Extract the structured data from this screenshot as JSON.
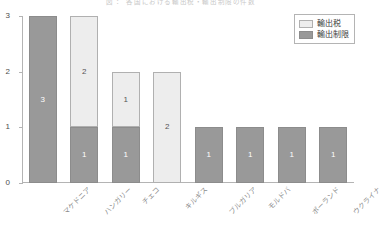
{
  "chart_data": {
    "type": "bar",
    "title": "図 ：  各国における輸出税・輸出制限の件数",
    "xlabel": "",
    "ylabel": "",
    "ylim": [
      0,
      3
    ],
    "yticks": [
      "0",
      "1",
      "2",
      "3"
    ],
    "grid": false,
    "stacked": true,
    "legend_position": "top-right",
    "categories": [
      "マケドニア",
      "ハンガリー",
      "チェコ",
      "キルギス",
      "ブルガリア",
      "モルドバ",
      "ポーランド",
      "ウクライナ"
    ],
    "series": [
      {
        "name": "輸出制限",
        "color": "#999999",
        "values": [
          3,
          1,
          1,
          0,
          1,
          1,
          1,
          1
        ]
      },
      {
        "name": "輸出税",
        "color": "#ededed",
        "values": [
          0,
          2,
          1,
          2,
          0,
          0,
          0,
          0
        ]
      }
    ],
    "bar_labels": [
      [
        {
          "series": "輸出制限",
          "text": "3"
        }
      ],
      [
        {
          "series": "輸出制限",
          "text": "1"
        },
        {
          "series": "輸出税",
          "text": "2"
        }
      ],
      [
        {
          "series": "輸出制限",
          "text": "1"
        },
        {
          "series": "輸出税",
          "text": "1"
        }
      ],
      [
        {
          "series": "輸出税",
          "text": "2"
        }
      ],
      [
        {
          "series": "輸出制限",
          "text": "1"
        }
      ],
      [
        {
          "series": "輸出制限",
          "text": "1"
        }
      ],
      [
        {
          "series": "輸出制限",
          "text": "1"
        }
      ],
      [
        {
          "series": "輸出制限",
          "text": "1"
        }
      ]
    ]
  },
  "legend": {
    "items": [
      {
        "label": "輸出税",
        "swatch": "tax"
      },
      {
        "label": "輸出制限",
        "swatch": "restriction"
      }
    ]
  }
}
